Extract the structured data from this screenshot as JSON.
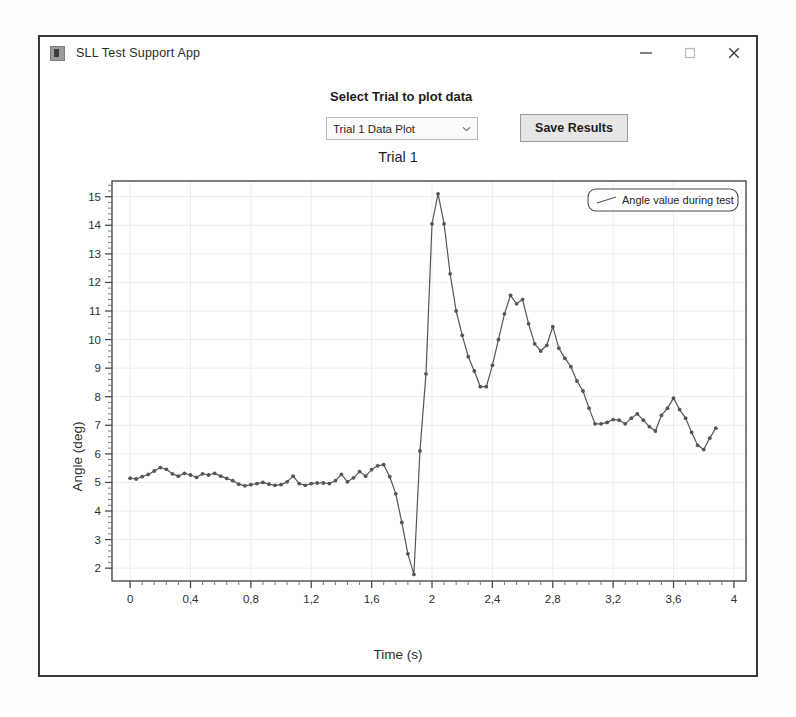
{
  "window": {
    "title": "SLL Test Support App",
    "icon": "app-icon",
    "controls": {
      "minimize": "minimize-icon",
      "maximize": "maximize-icon",
      "close": "close-icon"
    }
  },
  "toolbar": {
    "select_label": "Select Trial to plot data",
    "trial_select_value": "Trial 1 Data Plot",
    "trial_select_icon": "chevron-down-icon",
    "save_label": "Save Results"
  },
  "chart_data": {
    "type": "line",
    "title": "Trial 1",
    "xlabel": "Time (s)",
    "ylabel": "Angle (deg)",
    "xlim": [
      -0.12,
      4.08
    ],
    "ylim": [
      1.55,
      15.55
    ],
    "xticks": [
      "0",
      "0,4",
      "0,8",
      "1,2",
      "1,6",
      "2",
      "2,4",
      "2,8",
      "3,2",
      "3,6",
      "4"
    ],
    "xtick_values": [
      0,
      0.4,
      0.8,
      1.2,
      1.6,
      2.0,
      2.4,
      2.8,
      3.2,
      3.6,
      4.0
    ],
    "yticks": [
      "2",
      "3",
      "4",
      "5",
      "6",
      "7",
      "8",
      "9",
      "10",
      "11",
      "12",
      "13",
      "14",
      "15"
    ],
    "ytick_values": [
      2,
      3,
      4,
      5,
      6,
      7,
      8,
      9,
      10,
      11,
      12,
      13,
      14,
      15
    ],
    "grid": true,
    "legend_position": "top-right",
    "legend": [
      "Angle value during test"
    ],
    "line_color": "#555555",
    "marker": "circle",
    "series": [
      {
        "name": "Angle value during test",
        "x": [
          0.0,
          0.04,
          0.08,
          0.12,
          0.16,
          0.2,
          0.24,
          0.28,
          0.32,
          0.36,
          0.4,
          0.44,
          0.48,
          0.52,
          0.56,
          0.6,
          0.64,
          0.68,
          0.72,
          0.76,
          0.8,
          0.84,
          0.88,
          0.92,
          0.96,
          1.0,
          1.04,
          1.08,
          1.12,
          1.16,
          1.2,
          1.24,
          1.28,
          1.32,
          1.36,
          1.4,
          1.44,
          1.48,
          1.52,
          1.56,
          1.6,
          1.64,
          1.68,
          1.72,
          1.76,
          1.8,
          1.84,
          1.88,
          1.92,
          1.96,
          2.0,
          2.04,
          2.08,
          2.12,
          2.16,
          2.2,
          2.24,
          2.28,
          2.32,
          2.36,
          2.4,
          2.44,
          2.48,
          2.52,
          2.56,
          2.6,
          2.64,
          2.68,
          2.72,
          2.76,
          2.8,
          2.84,
          2.88,
          2.92,
          2.96,
          3.0,
          3.04,
          3.08,
          3.12,
          3.16,
          3.2,
          3.24,
          3.28,
          3.32,
          3.36,
          3.4,
          3.44,
          3.48,
          3.52,
          3.56,
          3.6,
          3.64,
          3.68,
          3.72,
          3.76,
          3.8,
          3.84,
          3.88
        ],
        "y": [
          5.15,
          5.12,
          5.2,
          5.28,
          5.4,
          5.52,
          5.46,
          5.3,
          5.22,
          5.32,
          5.26,
          5.18,
          5.3,
          5.26,
          5.32,
          5.22,
          5.14,
          5.06,
          4.94,
          4.88,
          4.92,
          4.96,
          5.0,
          4.94,
          4.9,
          4.92,
          5.02,
          5.22,
          4.96,
          4.9,
          4.96,
          4.98,
          4.98,
          4.96,
          5.06,
          5.28,
          5.02,
          5.16,
          5.38,
          5.22,
          5.45,
          5.58,
          5.62,
          5.2,
          4.6,
          3.6,
          2.5,
          1.78,
          6.1,
          8.8,
          14.05,
          15.1,
          14.05,
          12.3,
          11.0,
          10.15,
          9.4,
          8.9,
          8.35,
          8.35,
          9.1,
          10.0,
          10.9,
          11.55,
          11.25,
          11.4,
          10.55,
          9.85,
          9.6,
          9.8,
          10.45,
          9.7,
          9.35,
          9.05,
          8.55,
          8.2,
          7.6,
          7.05,
          7.05,
          7.1,
          7.2,
          7.18,
          7.05,
          7.25,
          7.4,
          7.18,
          6.95,
          6.8,
          7.35,
          7.6,
          7.95,
          7.55,
          7.25,
          6.75,
          6.3,
          6.15,
          6.55,
          6.9
        ]
      }
    ]
  }
}
